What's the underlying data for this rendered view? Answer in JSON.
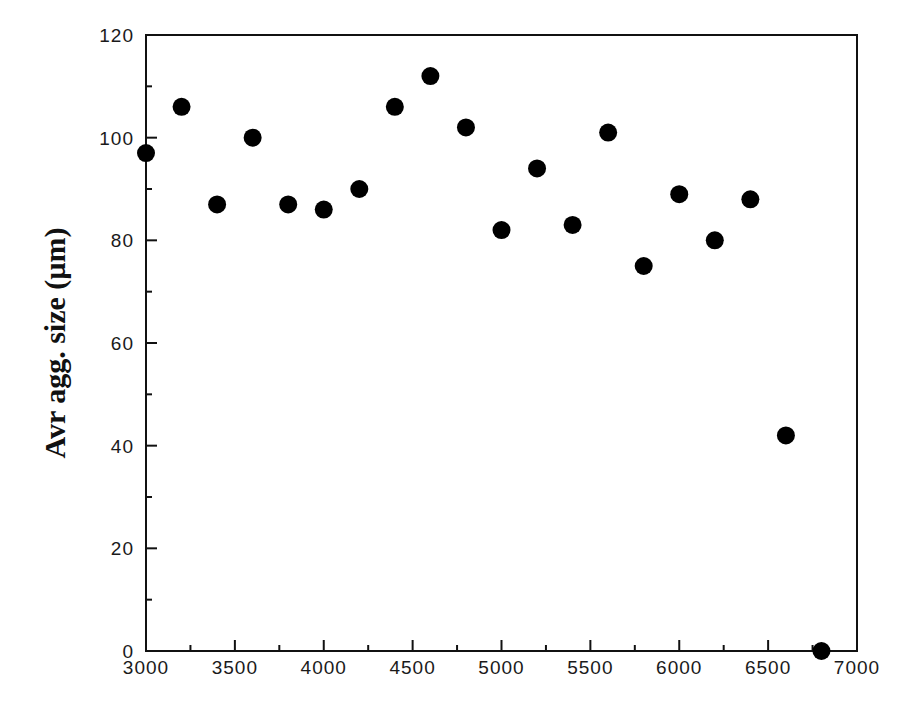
{
  "chart_data": {
    "type": "scatter",
    "title": "",
    "xlabel": "",
    "ylabel": "Avr agg. size (µm)",
    "xlim": [
      3000,
      7000
    ],
    "ylim": [
      0,
      120
    ],
    "x_ticks": [
      3000,
      3500,
      4000,
      4500,
      5000,
      5500,
      6000,
      6500,
      7000
    ],
    "x_tick_labels": [
      "3000",
      "3500",
      "4000",
      "4500",
      "5000",
      "5500",
      "6000",
      "6500",
      "7000"
    ],
    "x_minor_step": 250,
    "y_ticks": [
      0,
      20,
      40,
      60,
      80,
      100,
      120
    ],
    "y_tick_labels": [
      "0",
      "20",
      "40",
      "60",
      "80",
      "100",
      "120"
    ],
    "y_minor_step": 10,
    "grid": false,
    "legend": null,
    "marker": {
      "shape": "filled-circle",
      "color": "#000000"
    },
    "series": [
      {
        "name": "Avr agg. size",
        "x": [
          3000,
          3200,
          3400,
          3600,
          3800,
          4000,
          4200,
          4400,
          4600,
          4800,
          5000,
          5200,
          5400,
          5600,
          5800,
          6000,
          6200,
          6400,
          6600,
          6800
        ],
        "y": [
          97,
          106,
          87,
          100,
          87,
          86,
          90,
          106,
          112,
          102,
          82,
          94,
          83,
          101,
          75,
          89,
          80,
          88,
          42,
          0
        ]
      }
    ]
  },
  "colors": {
    "axis": "#111111",
    "marker": "#000000",
    "background": "#ffffff"
  }
}
